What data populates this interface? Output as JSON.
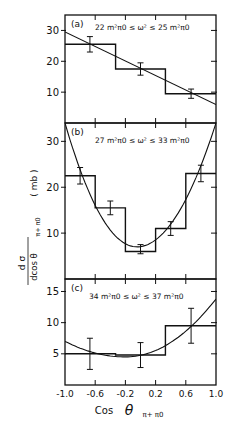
{
  "figure": {
    "ylabel": "dσ/dcos θπ+π0 (mb)",
    "ylabel_num": "d σ",
    "ylabel_den": "dcos θ",
    "ylabel_sub": "π+ π0",
    "ylabel_unit": "( mb )",
    "xlabel": "Cos θπ+ π0",
    "xlabel_main": "Cos",
    "xlabel_theta": "θ",
    "xlabel_sub": "π+  π0"
  },
  "chart_data": [
    {
      "type": "bar",
      "panel": "(a)",
      "title": "22 m²π0 ≤ ω² ≤ 25 m²π0",
      "xlabel": "Cos θπ+π0",
      "ylabel": "dσ/dcos θπ+π0 (mb)",
      "xlim": [
        -1.0,
        1.0
      ],
      "ylim": [
        0,
        35
      ],
      "yticks": [
        10,
        20,
        30
      ],
      "bins": [
        [
          -1.0,
          -0.33
        ],
        [
          -0.33,
          0.33
        ],
        [
          0.33,
          1.0
        ]
      ],
      "values": [
        25.5,
        17.5,
        9.5
      ],
      "points": [
        {
          "x": -0.67,
          "y": 25.5,
          "err": 2.5
        },
        {
          "x": 0.0,
          "y": 17.5,
          "err": 2.0
        },
        {
          "x": 0.67,
          "y": 9.5,
          "err": 1.5
        }
      ],
      "fit": {
        "type": "linear",
        "x": [
          -1.0,
          1.0
        ],
        "y": [
          29.5,
          6.0
        ]
      }
    },
    {
      "type": "bar",
      "panel": "(b)",
      "title": "27 m²π0 ≤ ω² ≤ 33 m²π0",
      "xlabel": "Cos θπ+π0",
      "ylabel": "dσ/dcos θπ+π0 (mb)",
      "xlim": [
        -1.0,
        1.0
      ],
      "ylim": [
        0,
        34
      ],
      "yticks": [
        10,
        20,
        30
      ],
      "bins": [
        [
          -1.0,
          -0.6
        ],
        [
          -0.6,
          -0.2
        ],
        [
          -0.2,
          0.2
        ],
        [
          0.2,
          0.6
        ],
        [
          0.6,
          1.0
        ]
      ],
      "values": [
        22.5,
        15.5,
        6.0,
        11.0,
        23.0
      ],
      "points": [
        {
          "x": -0.8,
          "y": 22.5,
          "err": 1.8
        },
        {
          "x": -0.4,
          "y": 15.5,
          "err": 1.5
        },
        {
          "x": 0.0,
          "y": 6.5,
          "err": 1.0
        },
        {
          "x": 0.4,
          "y": 11.0,
          "err": 1.5
        },
        {
          "x": 0.8,
          "y": 23.0,
          "err": 1.8
        }
      ],
      "fit": {
        "type": "quadratic",
        "vertex_x": -0.05,
        "vertex_y": 7.0,
        "endpoints_y": [
          34.0,
          34.0
        ]
      }
    },
    {
      "type": "bar",
      "panel": "(c)",
      "title": "34 m²π0 ≤ ω² ≤ 37 m²π0",
      "xlabel": "Cos θπ+π0",
      "ylabel": "dσ/dcos θπ+π0 (mb)",
      "xlim": [
        -1.0,
        1.0
      ],
      "ylim": [
        0,
        17
      ],
      "yticks": [
        5,
        10,
        15
      ],
      "xticks": [
        -1.0,
        -0.6,
        -0.2,
        0.2,
        0.6,
        1.0
      ],
      "xticklabels": [
        "-1.0",
        "-0.6",
        "-0.2",
        "0.2",
        "0.6",
        "1.0"
      ],
      "bins": [
        [
          -1.0,
          -0.33
        ],
        [
          -0.33,
          0.33
        ],
        [
          0.33,
          1.0
        ]
      ],
      "values": [
        5.0,
        4.8,
        9.5
      ],
      "points": [
        {
          "x": -0.67,
          "y": 5.0,
          "err": 2.5
        },
        {
          "x": 0.0,
          "y": 4.8,
          "err": 2.0
        },
        {
          "x": 0.67,
          "y": 9.5,
          "err": 2.8
        }
      ],
      "fit": {
        "type": "quadratic",
        "vertex_x": -0.2,
        "vertex_y": 4.5,
        "endpoints_y": [
          7.0,
          13.8
        ]
      }
    }
  ]
}
